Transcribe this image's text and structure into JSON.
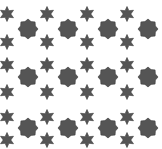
{
  "pattern": {
    "width": 162,
    "height": 149,
    "background": "#ffffff",
    "fill": "#555555",
    "stroke": "#3a3a3a",
    "stars": {
      "shape": "six-point-star",
      "outer_radius": 7.5,
      "inner_radius": 3.8,
      "x": [
        7,
        47,
        87,
        127
      ],
      "y": [
        14,
        42,
        65,
        92,
        117,
        140
      ]
    },
    "octagrams": {
      "shape": "eight-point-burst",
      "outer_radius": 10,
      "inner_radius": 8,
      "x": [
        28,
        68,
        108,
        148
      ],
      "y": [
        29,
        77,
        128
      ]
    }
  }
}
